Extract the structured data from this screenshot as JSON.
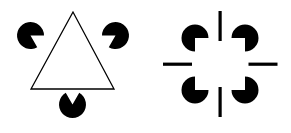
{
  "page": {
    "background_color": "#ffffff",
    "ink_color": "#000000",
    "width": 291,
    "height": 133
  },
  "figures": [
    {
      "id": "kanizsa-triangle",
      "name": "Kanizsa triangle",
      "description": "Three black pac-man inducers plus a thin outlined triangle produce an illusory white triangle pointing downward.",
      "center": {
        "x": 73,
        "y": 64
      },
      "outline_triangle": {
        "name": "outlined-triangle-up",
        "points": "73,12 31,89 114,89",
        "stroke_color": "#000000",
        "stroke_width": 1.3,
        "fill": "none"
      },
      "inducers": [
        {
          "name": "pacman-top-left",
          "cx": 30.5,
          "cy": 35.5,
          "r": 13.5,
          "wedge_start_deg": 0,
          "wedge_end_deg": 60,
          "fill": "#000000"
        },
        {
          "name": "pacman-top-right",
          "cx": 115.5,
          "cy": 35.5,
          "r": 13.5,
          "wedge_start_deg": 120,
          "wedge_end_deg": 180,
          "fill": "#000000"
        },
        {
          "name": "pacman-bottom-center",
          "cx": 72.5,
          "cy": 104.5,
          "r": 13.5,
          "wedge_start_deg": 240,
          "wedge_end_deg": 300,
          "fill": "#000000"
        }
      ]
    },
    {
      "id": "kanizsa-square",
      "name": "Kanizsa square with line inducers",
      "description": "Four black quarter-cut discs at the corners plus four short line segments on the edge midpoints produce an illusory white square.",
      "center": {
        "x": 220,
        "y": 64
      },
      "inducers": [
        {
          "name": "pacman-top-left",
          "cx": 195,
          "cy": 38,
          "r": 13.5,
          "wedge_start_deg": 0,
          "wedge_end_deg": 90,
          "fill": "#000000"
        },
        {
          "name": "pacman-top-right",
          "cx": 245,
          "cy": 38,
          "r": 13.5,
          "wedge_start_deg": 90,
          "wedge_end_deg": 180,
          "fill": "#000000"
        },
        {
          "name": "pacman-bottom-left",
          "cx": 195,
          "cy": 90,
          "r": 13.5,
          "wedge_start_deg": 270,
          "wedge_end_deg": 360,
          "fill": "#000000"
        },
        {
          "name": "pacman-bottom-right",
          "cx": 245,
          "cy": 90,
          "r": 13.5,
          "wedge_start_deg": 180,
          "wedge_end_deg": 270,
          "fill": "#000000"
        }
      ],
      "bars": [
        {
          "name": "bar-top-vertical",
          "x": 218.5,
          "y": 11,
          "width": 3.2,
          "height": 30,
          "fill": "#000000"
        },
        {
          "name": "bar-bottom-vertical",
          "x": 218.5,
          "y": 87,
          "width": 3.2,
          "height": 30,
          "fill": "#000000"
        },
        {
          "name": "bar-left-horizontal",
          "x": 163,
          "y": 62.6,
          "width": 29,
          "height": 3.2,
          "fill": "#000000"
        },
        {
          "name": "bar-right-horizontal",
          "x": 248.5,
          "y": 62.6,
          "width": 29,
          "height": 3.2,
          "fill": "#000000"
        }
      ]
    }
  ]
}
